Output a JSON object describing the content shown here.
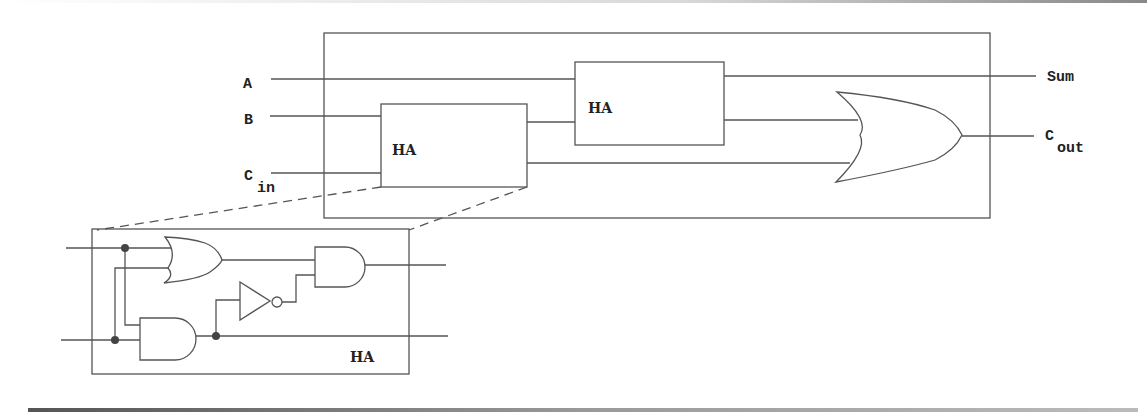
{
  "diagram": {
    "inputs": {
      "a": "A",
      "b": "B",
      "cin_main": "C",
      "cin_sub": "in"
    },
    "outputs": {
      "sum": "Sum",
      "cout_main": "C",
      "cout_sub": "out"
    },
    "blocks": {
      "ha1_label": "HA",
      "ha2_label": "HA",
      "detail_label": "HA"
    },
    "components": [
      "HA",
      "HA",
      "OR",
      "OR",
      "AND",
      "AND",
      "NOT"
    ],
    "colors": {
      "line": "#555555",
      "text": "#222222",
      "junction": "#444444",
      "background": "#ffffff"
    }
  }
}
